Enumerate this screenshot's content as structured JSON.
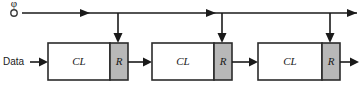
{
  "diagram": {
    "canvas": {
      "width": 362,
      "height": 106,
      "background": "#ffffff"
    },
    "colors": {
      "line": "#1a1a1a",
      "box_outline": "#2b2b2b",
      "register_fill": "#b8b8b8",
      "logic_fill": "#ffffff"
    },
    "clock": {
      "label": "φ",
      "source_x": 14,
      "source_y": 13,
      "bus_y": 13,
      "bus_start_x": 22,
      "bus_end_x": 357,
      "arrow_positions_x": [
        88,
        214,
        352
      ],
      "drop_positions_x": [
        118,
        222,
        330
      ],
      "drop_end_y": 43
    },
    "data_input": {
      "label": "Data",
      "label_x": 3,
      "label_y": 62,
      "arrow_start_x": 30,
      "arrow_end_x": 48,
      "y": 62
    },
    "output": {
      "arrow_start_x": 340,
      "arrow_end_x": 360,
      "y": 62
    },
    "stages": [
      {
        "id": "stage-1",
        "logic_label": "CL",
        "register_label": "R",
        "logic": {
          "x": 48,
          "y": 43,
          "width": 62,
          "height": 37
        },
        "register": {
          "x": 110,
          "y": 43,
          "width": 18,
          "height": 37
        },
        "link_out": {
          "from_x": 128,
          "to_x": 152,
          "y": 62
        }
      },
      {
        "id": "stage-2",
        "logic_label": "CL",
        "register_label": "R",
        "logic": {
          "x": 152,
          "y": 43,
          "width": 62,
          "height": 37
        },
        "register": {
          "x": 214,
          "y": 43,
          "width": 18,
          "height": 37
        },
        "link_out": {
          "from_x": 232,
          "to_x": 258,
          "y": 62
        }
      },
      {
        "id": "stage-3",
        "logic_label": "CL",
        "register_label": "R",
        "logic": {
          "x": 258,
          "y": 43,
          "width": 64,
          "height": 37
        },
        "register": {
          "x": 322,
          "y": 43,
          "width": 18,
          "height": 37
        },
        "link_out": null
      }
    ]
  }
}
